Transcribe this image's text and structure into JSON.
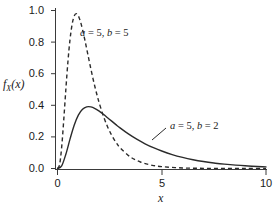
{
  "chart_data": {
    "type": "line",
    "title": "",
    "subtitle": "",
    "xlabel": "x",
    "ylabel": "f_X(x)",
    "xlim": [
      0,
      10
    ],
    "ylim": [
      0,
      1.0
    ],
    "xticks": [
      "0",
      "5",
      "10"
    ],
    "xtick_values": [
      0,
      5,
      10
    ],
    "yticks": [
      "0.0",
      "0.2",
      "0.4",
      "0.6",
      "0.8",
      "1.0"
    ],
    "ytick_values": [
      0.0,
      0.2,
      0.4,
      0.6,
      0.8,
      1.0
    ],
    "grid": false,
    "legend_position": "inline-annotation",
    "series": [
      {
        "name": "a = 5, b = 5",
        "style": "dashed",
        "color": "#2b2b2b",
        "peak_x": 0.8,
        "peak_y": 0.98,
        "x": [
          0.0,
          0.1,
          0.2,
          0.3,
          0.4,
          0.5,
          0.6,
          0.7,
          0.8,
          0.9,
          1.0,
          1.1,
          1.2,
          1.3,
          1.4,
          1.5,
          1.6,
          1.7,
          1.8,
          1.9,
          2.0,
          2.2,
          2.4,
          2.6,
          2.8,
          3.0,
          3.5,
          4.0,
          4.5,
          5.0,
          6.0,
          7.0,
          8.0,
          9.0,
          10.0
        ],
        "y": [
          0.0,
          0.0158,
          0.0902,
          0.2055,
          0.3337,
          0.4512,
          0.5446,
          0.6087,
          0.6439,
          0.6542,
          0.6447,
          0.6209,
          0.5874,
          0.5481,
          0.5059,
          0.463,
          0.421,
          0.3809,
          0.3434,
          0.3088,
          0.2771,
          0.2218,
          0.1767,
          0.1404,
          0.1113,
          0.0881,
          0.0484,
          0.0265,
          0.0145,
          0.0079,
          0.0023,
          0.0007,
          0.0002,
          0.0001,
          0.0
        ]
      },
      {
        "name": "a = 5, b = 2",
        "style": "solid",
        "color": "#2b2b2b",
        "peak_x": 2.0,
        "peak_y": 0.39,
        "x": [
          0.0,
          0.2,
          0.4,
          0.6,
          0.8,
          1.0,
          1.2,
          1.4,
          1.6,
          1.8,
          2.0,
          2.2,
          2.4,
          2.6,
          2.8,
          3.0,
          3.4,
          3.8,
          4.2,
          4.6,
          5.0,
          5.5,
          6.0,
          6.5,
          7.0,
          7.5,
          8.0,
          9.0,
          10.0
        ],
        "y": [
          0.0,
          0.0162,
          0.0879,
          0.1814,
          0.2674,
          0.3297,
          0.3659,
          0.3809,
          0.3808,
          0.3708,
          0.3547,
          0.3352,
          0.3141,
          0.2926,
          0.2715,
          0.251,
          0.2136,
          0.181,
          0.1528,
          0.1286,
          0.108,
          0.0862,
          0.0686,
          0.0544,
          0.043,
          0.034,
          0.0268,
          0.0166,
          0.0102
        ]
      }
    ],
    "annotations": [
      {
        "text": "a = 5, b = 5",
        "italic_var_1": "a",
        "italic_var_2": "b",
        "value_1": "5",
        "value_2": "5",
        "x_px": 80,
        "y_px": 28
      },
      {
        "text": "a = 5, b = 2",
        "italic_var_1": "a",
        "italic_var_2": "b",
        "value_1": "5",
        "value_2": "2",
        "x_px": 170,
        "y_px": 127
      }
    ]
  },
  "axes": {
    "y_label_f": "f",
    "y_label_sub": "X",
    "y_label_paren": "(x)",
    "x_label": "x",
    "yticks": [
      {
        "label": "1.0",
        "top": 5
      },
      {
        "label": "0.8",
        "top": 37
      },
      {
        "label": "0.6",
        "top": 69
      },
      {
        "label": "0.4",
        "top": 101
      },
      {
        "label": "0.2",
        "top": 133
      },
      {
        "label": "0.0",
        "top": 164
      }
    ],
    "xticks": [
      {
        "label": "0",
        "left": 46
      },
      {
        "label": "5",
        "left": 151
      },
      {
        "label": "10",
        "left": 252
      }
    ]
  }
}
